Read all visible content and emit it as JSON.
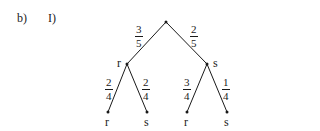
{
  "part_label": "b)",
  "sub_label": "I)",
  "tree": {
    "root": {
      "label": ""
    },
    "level1": [
      {
        "label": "r",
        "prob_num": "3",
        "prob_den": "5"
      },
      {
        "label": "s",
        "prob_num": "2",
        "prob_den": "5"
      }
    ],
    "level2": [
      {
        "parent": "r",
        "label": "r",
        "prob_num": "2",
        "prob_den": "4"
      },
      {
        "parent": "r",
        "label": "s",
        "prob_num": "2",
        "prob_den": "4"
      },
      {
        "parent": "s",
        "label": "r",
        "prob_num": "3",
        "prob_den": "4"
      },
      {
        "parent": "s",
        "label": "s",
        "prob_num": "1",
        "prob_den": "4"
      }
    ]
  },
  "colors": {
    "ink": "#1a1a1a",
    "background": "#ffffff"
  }
}
